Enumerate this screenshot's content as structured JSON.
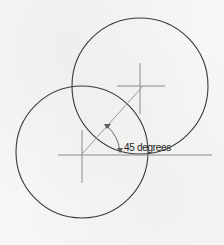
{
  "figure": {
    "type": "geometric-construction",
    "angle_label": "45 degrees",
    "angle_value_deg": 45,
    "circles": [
      {
        "name": "upper-circle",
        "cx": 140,
        "cy": 86,
        "r": 68
      },
      {
        "name": "lower-circle",
        "cx": 82,
        "cy": 152,
        "r": 66
      }
    ],
    "colors": {
      "background": "#f6f6f4",
      "circle_stroke": "#3a3a3a",
      "axis_stroke": "#8a8a8a",
      "label_text": "#222222"
    }
  }
}
